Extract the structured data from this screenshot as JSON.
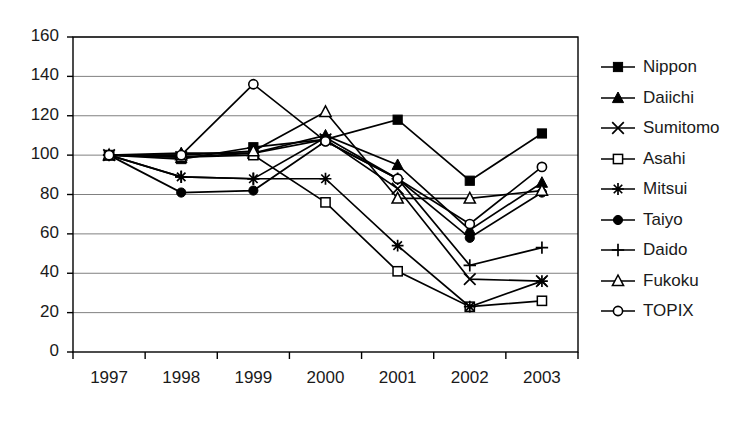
{
  "chart_data": {
    "type": "line",
    "title": "",
    "subtitle": "",
    "xlabel": "",
    "ylabel": "",
    "categories": [
      "1997",
      "1998",
      "1999",
      "2000",
      "2001",
      "2002",
      "2003"
    ],
    "ylim": [
      0,
      160
    ],
    "ytick_step": 20,
    "yticks": [
      "160",
      "140",
      "120",
      "100",
      "80",
      "60",
      "40",
      "20",
      "0"
    ],
    "grid": "horizontal",
    "legend_position": "right",
    "series": [
      {
        "name": "Nippon",
        "marker": "filled-square",
        "values": [
          100,
          98,
          104,
          108,
          118,
          87,
          111
        ]
      },
      {
        "name": "Daiichi",
        "marker": "filled-triangle",
        "values": [
          100,
          101,
          101,
          110,
          95,
          62,
          86
        ]
      },
      {
        "name": "Sumitomo",
        "marker": "cross",
        "values": [
          100,
          99,
          101,
          108,
          83,
          37,
          36
        ]
      },
      {
        "name": "Asahi",
        "marker": "open-square",
        "values": [
          100,
          99,
          100,
          76,
          41,
          23,
          26
        ]
      },
      {
        "name": "Mitsui",
        "marker": "asterisk",
        "values": [
          100,
          89,
          88,
          88,
          54,
          23,
          36
        ]
      },
      {
        "name": "Taiyo",
        "marker": "filled-circle",
        "values": [
          100,
          81,
          82,
          107,
          88,
          58,
          81
        ]
      },
      {
        "name": "Daido",
        "marker": "plus",
        "values": [
          100,
          89,
          88,
          109,
          88,
          44,
          53
        ]
      },
      {
        "name": "Fukoku",
        "marker": "open-triangle",
        "values": [
          100,
          100,
          102,
          122,
          78,
          78,
          82
        ]
      },
      {
        "name": "TOPIX",
        "marker": "open-circle",
        "values": [
          100,
          100,
          136,
          107,
          88,
          65,
          94
        ]
      }
    ]
  },
  "axes": {
    "plot_left": 73,
    "plot_right": 578,
    "plot_top": 37,
    "plot_bottom": 352
  },
  "legend": {
    "entries": [
      {
        "label": "Nippon"
      },
      {
        "label": "Daiichi"
      },
      {
        "label": "Sumitomo"
      },
      {
        "label": "Asahi"
      },
      {
        "label": "Mitsui"
      },
      {
        "label": "Taiyo"
      },
      {
        "label": "Daido"
      },
      {
        "label": "Fukoku"
      },
      {
        "label": "TOPIX"
      }
    ]
  },
  "colors": {
    "line": "#000000",
    "grid": "#808080",
    "axis": "#000000",
    "background": "#ffffff",
    "text": "#1a1a1a"
  }
}
